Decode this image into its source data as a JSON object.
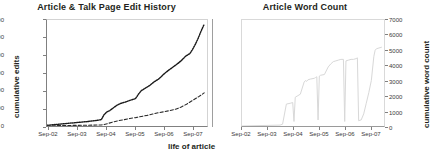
{
  "figure": {
    "xlabel": "life of article",
    "divider": "panel-divider"
  },
  "chart_data": [
    {
      "id": "edit-history",
      "type": "line",
      "title": "Article & Talk Page Edit History",
      "xlabel": "life of article",
      "ylabel": "cumulative edits",
      "ylim": [
        0,
        1200
      ],
      "yticks": [
        0,
        200,
        400,
        600,
        800,
        1000,
        1200
      ],
      "xticks": [
        "Sep-02",
        "Sep-03",
        "Sep-04",
        "Sep-05",
        "Sep-06",
        "Sep-07"
      ],
      "xlim": [
        0,
        5.6
      ],
      "grid": false,
      "legend": "none",
      "series": [
        {
          "name": "article edits",
          "style": "dotted",
          "color": "#1a1a1a",
          "x": [
            0.0,
            0.2,
            0.4,
            0.6,
            0.8,
            1.0,
            1.2,
            1.4,
            1.6,
            1.75,
            1.9,
            2.0,
            2.1,
            2.2,
            2.3,
            2.45,
            2.6,
            2.75,
            2.9,
            3.0,
            3.1,
            3.2,
            3.3,
            3.45,
            3.6,
            3.75,
            3.9,
            4.0,
            4.1,
            4.25,
            4.4,
            4.55,
            4.7,
            4.85,
            5.0,
            5.1,
            5.2,
            5.3,
            5.4,
            5.5
          ],
          "y": [
            8,
            14,
            20,
            26,
            32,
            38,
            44,
            50,
            58,
            64,
            72,
            130,
            160,
            175,
            200,
            235,
            258,
            272,
            290,
            300,
            310,
            360,
            400,
            430,
            460,
            500,
            530,
            560,
            590,
            630,
            665,
            700,
            740,
            790,
            820,
            870,
            930,
            1000,
            1080,
            1150
          ]
        },
        {
          "name": "talk page edits",
          "style": "dashed",
          "color": "#2b2b2b",
          "x": [
            0.0,
            0.4,
            0.8,
            1.2,
            1.6,
            1.9,
            2.0,
            2.15,
            2.3,
            2.5,
            2.7,
            2.9,
            3.1,
            3.3,
            3.5,
            3.7,
            3.9,
            4.1,
            4.3,
            4.5,
            4.7,
            4.9,
            5.1,
            5.3,
            5.5
          ],
          "y": [
            2,
            4,
            6,
            8,
            10,
            12,
            16,
            30,
            45,
            60,
            72,
            85,
            95,
            108,
            120,
            135,
            150,
            162,
            175,
            190,
            215,
            250,
            290,
            330,
            375
          ]
        }
      ]
    },
    {
      "id": "word-count",
      "type": "line",
      "title": "Article Word Count",
      "xlabel": "life of article",
      "ylabel": "cumulative word count",
      "ylim": [
        0,
        7000
      ],
      "yticks": [
        0,
        1000,
        2000,
        3000,
        4000,
        5000,
        6000,
        7000
      ],
      "xticks": [
        "Sep-02",
        "Sep-03",
        "Sep-04",
        "Sep-05",
        "Sep-06",
        "Sep-07"
      ],
      "xlim": [
        0,
        5.6
      ],
      "grid": false,
      "legend": "none",
      "series": [
        {
          "name": "word count",
          "style": "solid",
          "color": "#d8d8d8",
          "x": [
            0.0,
            1.5,
            1.6,
            1.75,
            1.9,
            2.0,
            2.05,
            2.1,
            2.2,
            2.3,
            2.45,
            2.5,
            2.55,
            2.6,
            2.7,
            2.85,
            2.9,
            2.95,
            3.0,
            3.05,
            3.1,
            3.25,
            3.4,
            3.5,
            3.6,
            3.7,
            3.8,
            3.9,
            4.0,
            4.05,
            4.1,
            4.2,
            4.3,
            4.4,
            4.5,
            4.55,
            4.6,
            4.7,
            4.8,
            4.9,
            5.0,
            5.1,
            5.2,
            5.25,
            5.3,
            5.4,
            5.5
          ],
          "y": [
            0,
            60,
            120,
            1450,
            1500,
            1550,
            300,
            1900,
            2000,
            2100,
            2900,
            3000,
            2950,
            3050,
            3100,
            3150,
            3200,
            3250,
            400,
            3300,
            3350,
            3400,
            3900,
            4100,
            4250,
            4300,
            4350,
            4400,
            4400,
            300,
            4300,
            4350,
            4400,
            4400,
            4450,
            4500,
            350,
            400,
            800,
            1500,
            2200,
            3000,
            4600,
            5000,
            5100,
            5150,
            5200
          ]
        }
      ]
    }
  ]
}
